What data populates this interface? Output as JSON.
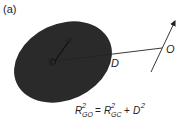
{
  "panel_label": "(a)",
  "labels": {
    "center": "C",
    "distance": "D",
    "axis_point": "O"
  },
  "equation": {
    "lhs_base": "R",
    "lhs_sup": "2",
    "lhs_sub": "GO",
    "equals": "=",
    "rhs1_base": "R",
    "rhs1_sup": "2",
    "rhs1_sub": "GC",
    "plus": "+",
    "rhs2_base": "D",
    "rhs2_sup": "2"
  },
  "colors": {
    "body_fill": "#2a2a2a",
    "line": "#222222",
    "background": "#ffffff"
  }
}
